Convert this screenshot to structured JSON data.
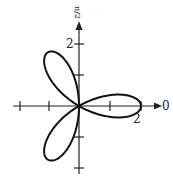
{
  "chart_data": {
    "type": "line",
    "title": "",
    "equation": "r = 2cos(3θ)",
    "coordinate_system": "polar",
    "petals": 3,
    "max_radius": 2,
    "petal_angles_deg": [
      0,
      120,
      240
    ],
    "axis_labels": {
      "polar_axis": "0",
      "vertical_axis": "π/2"
    },
    "tick_labels": [
      {
        "axis": "vertical",
        "value": "2"
      },
      {
        "axis": "horizontal",
        "value": "2"
      }
    ],
    "xlim": [
      -2,
      2
    ],
    "ylim": [
      -2,
      2
    ],
    "grid": false
  },
  "labels": {
    "top": "π/2",
    "right": "0",
    "vertical_tick": "2",
    "horizontal_tick": "2"
  },
  "colors": {
    "curve": "#111111",
    "axis": "#222222"
  }
}
